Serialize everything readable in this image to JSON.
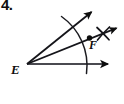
{
  "figure": {
    "problem_number": "4.",
    "background_color": "#ffffff",
    "ink_color": "#0d0d0d",
    "width": 124,
    "height": 104
  },
  "labels": [
    {
      "id": "vertex-E",
      "text": "E",
      "x": 11,
      "y": 63
    },
    {
      "id": "point-F",
      "text": "F",
      "x": 89,
      "y": 39
    }
  ],
  "geometry": {
    "vertex": {
      "name": "E",
      "x": 27,
      "y": 64
    },
    "rays": [
      {
        "id": "ray-lower-horizontal",
        "name": "lower side of angle",
        "from": {
          "x": 27,
          "y": 64
        },
        "to": {
          "x": 111,
          "y": 64
        },
        "arrowhead": true
      },
      {
        "id": "ray-bisector",
        "name": "angle bisector through F",
        "from": {
          "x": 27,
          "y": 64
        },
        "to": {
          "x": 119,
          "y": 27
        },
        "arrowhead": true
      },
      {
        "id": "ray-upper",
        "name": "upper side of angle",
        "from": {
          "x": 27,
          "y": 64
        },
        "to": {
          "x": 94,
          "y": 10
        },
        "arrowhead": true
      }
    ],
    "construction_arc": {
      "id": "arc-from-vertex",
      "name": "arc centered at E crossing both sides of the angle",
      "center": {
        "x": 27,
        "y": 64
      },
      "radius": 60,
      "start": {
        "x": 61,
        "y": 16
      },
      "end": {
        "x": 86,
        "y": 73
      }
    },
    "crossing_arcs": {
      "id": "arcs-intersecting-at-F",
      "name": "pair of intersecting arcs forming an X on the bisector",
      "center": {
        "x": 103,
        "y": 33
      },
      "size": 13
    },
    "marked_point": {
      "id": "point-F-dot",
      "name": "F",
      "x": 89,
      "y": 38,
      "radius": 2.6
    }
  }
}
